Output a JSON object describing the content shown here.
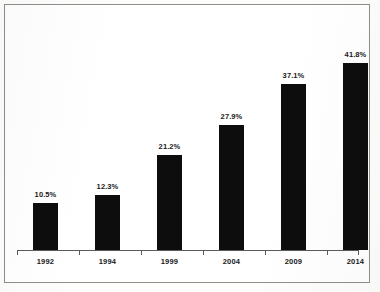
{
  "chart_data": {
    "type": "bar",
    "title": "",
    "subtitle": "",
    "xlabel": "",
    "ylabel": "",
    "grid": false,
    "legend": false,
    "ylim": [
      0,
      50
    ],
    "categories": [
      "1992",
      "1994",
      "1999",
      "2004",
      "2009",
      "2014"
    ],
    "values": [
      10.5,
      12.3,
      21.2,
      27.9,
      37.1,
      41.8
    ],
    "value_labels": [
      "10.5%",
      "12.3%",
      "21.2%",
      "27.9%",
      "37.1%",
      "41.8%"
    ],
    "series": [
      {
        "name": "",
        "values": [
          10.5,
          12.3,
          21.2,
          27.9,
          37.1,
          41.8
        ]
      }
    ],
    "bar_color": "#0d0d0d",
    "axis_color": "#5a5a5a",
    "frame_color": "#8d8d8d",
    "background": "#ffffff"
  },
  "figure": {
    "frame_label": "chart-border",
    "axis_label": "x-axis-baseline"
  }
}
